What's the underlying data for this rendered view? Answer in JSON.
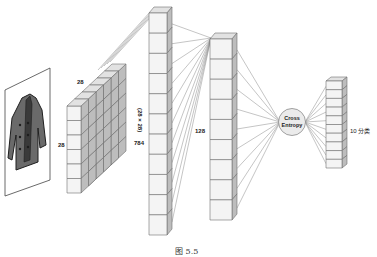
{
  "figure": {
    "caption": "图 5.5",
    "colors": {
      "cell_front": "#f4f4f4",
      "cell_side": "#bdbdbd",
      "cell_top": "#e2e2e2",
      "cell_stroke": "#6e6e6e",
      "connection_line": "#8a8a8a",
      "frame_stroke": "#444444"
    }
  },
  "input_image": {
    "subject": "coat",
    "icon": "coat-icon"
  },
  "input_grid": {
    "width_label": "28",
    "height_label": "28",
    "rows": 6,
    "depth": 5
  },
  "layers": [
    {
      "name": "flatten",
      "size_label": "784",
      "formula_label": "(28 × 28)",
      "cells": 11
    },
    {
      "name": "hidden",
      "size_label": "128",
      "cells": 9
    },
    {
      "name": "loss",
      "label_line1": "Cross",
      "label_line2": "Entropy"
    },
    {
      "name": "output",
      "size_label": "10 分类",
      "cells": 10
    }
  ]
}
